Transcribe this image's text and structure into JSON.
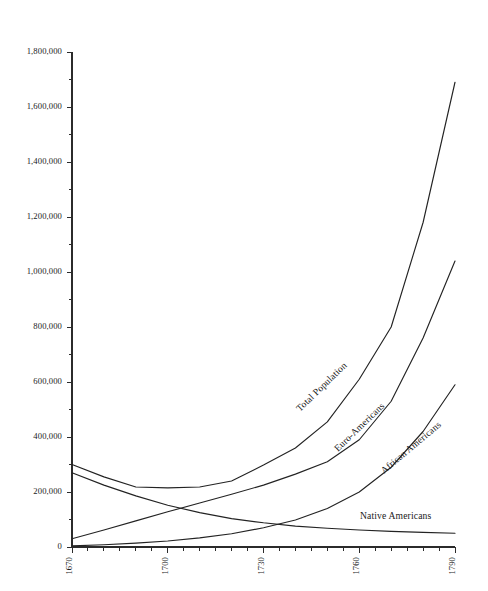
{
  "chart_data": {
    "type": "line",
    "title": "",
    "subtitle": "",
    "xlabel": "",
    "ylabel": "",
    "xlim": [
      1670,
      1790
    ],
    "ylim": [
      0,
      1800000
    ],
    "grid": false,
    "legend": "inline-labels",
    "y_ticks": [
      0,
      200000,
      400000,
      600000,
      800000,
      1000000,
      1200000,
      1400000,
      1600000,
      1800000
    ],
    "y_tick_labels": [
      "0",
      "200,000",
      "400,000",
      "600,000",
      "800,000",
      "1,000,000",
      "1,200,000",
      "1,400,000",
      "1,600,000",
      "1,800,000"
    ],
    "y_minor_step": 100000,
    "x_ticks": [
      1670,
      1680,
      1690,
      1700,
      1710,
      1720,
      1730,
      1740,
      1750,
      1760,
      1770,
      1780,
      1790
    ],
    "x_tick_labels": [
      "1670",
      "",
      "",
      "1700",
      "",
      "",
      "1730",
      "",
      "",
      "1760",
      "",
      "",
      "1790"
    ],
    "x_labeled_ticks": [
      1670,
      1700,
      1730,
      1760,
      1790
    ],
    "x_minor_step": 5,
    "x": [
      1670,
      1680,
      1690,
      1700,
      1710,
      1720,
      1730,
      1740,
      1750,
      1760,
      1770,
      1780,
      1790
    ],
    "series": [
      {
        "name": "Total Population",
        "label": "Total Population",
        "color": "#232323",
        "label_rotation": -44,
        "label_x": 300,
        "label_y": 412,
        "values": [
          300000,
          255000,
          218000,
          215000,
          218000,
          240000,
          298000,
          360000,
          455000,
          610000,
          800000,
          1180000,
          1690000
        ]
      },
      {
        "name": "Euro-Americans",
        "label": "Euro-Americans",
        "color": "#232323",
        "label_rotation": -44,
        "label_x": 338,
        "label_y": 452,
        "values": [
          30000,
          62000,
          95000,
          128000,
          160000,
          192000,
          225000,
          265000,
          310000,
          390000,
          530000,
          760000,
          1040000
        ]
      },
      {
        "name": "African Americans",
        "label": "African Americans",
        "color": "#232323",
        "label_rotation": -40,
        "label_x": 384,
        "label_y": 474,
        "values": [
          4000,
          8000,
          14000,
          22000,
          33000,
          48000,
          70000,
          98000,
          140000,
          200000,
          290000,
          420000,
          590000
        ]
      },
      {
        "name": "Native Americans",
        "label": "Native Americans",
        "color": "#232323",
        "label_rotation": 0,
        "label_x": 360,
        "label_y": 519,
        "values": [
          270000,
          225000,
          186000,
          152000,
          125000,
          103000,
          88000,
          76000,
          68000,
          62000,
          57000,
          53000,
          50000
        ]
      }
    ]
  },
  "geometry": {
    "plot_left": 72,
    "plot_right": 455,
    "plot_top": 52,
    "plot_bottom": 547
  }
}
